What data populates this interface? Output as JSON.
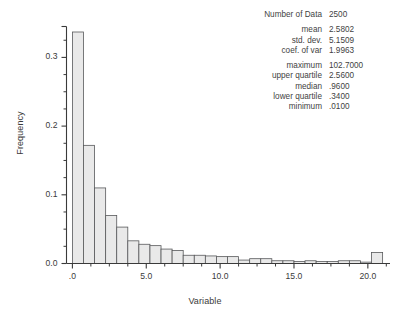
{
  "stats": {
    "rows": [
      {
        "label": "Number of Data",
        "value": "2500"
      },
      {
        "label": "mean",
        "value": "2.5802"
      },
      {
        "label": "std. dev.",
        "value": "5.1509"
      },
      {
        "label": "coef. of var",
        "value": "1.9963"
      },
      {
        "label": "maximum",
        "value": "102.7000"
      },
      {
        "label": "upper quartile",
        "value": "2.5600"
      },
      {
        "label": "median",
        "value": ".9600"
      },
      {
        "label": "lower quartile",
        "value": ".3400"
      },
      {
        "label": "minimum",
        "value": ".0100"
      }
    ]
  },
  "chart_data": {
    "type": "bar",
    "title": "",
    "xlabel": "Variable",
    "ylabel": "Frequency",
    "xlim": [
      -0.4,
      21.5
    ],
    "ylim": [
      0.0,
      0.345
    ],
    "grid": false,
    "legend": null,
    "bin_width": 0.75,
    "xticks": [
      0.0,
      5.0,
      10.0,
      15.0,
      20.0
    ],
    "xtick_labels": [
      ".0",
      "5.0",
      "10.0",
      "15.0",
      "20.0"
    ],
    "xminor_step": 1.25,
    "yticks": [
      0.0,
      0.1,
      0.2,
      0.3
    ],
    "ytick_labels": [
      "0.0",
      "0.1",
      "0.2",
      "0.3"
    ],
    "yminor_step": 0.025,
    "bar_fill": "#e9e9e9",
    "bar_stroke": "#58595b",
    "axis_color": "#3a3a3a",
    "bins": [
      {
        "x0": 0.0,
        "x1": 0.75,
        "value": 0.337
      },
      {
        "x0": 0.75,
        "x1": 1.5,
        "value": 0.172
      },
      {
        "x0": 1.5,
        "x1": 2.25,
        "value": 0.11
      },
      {
        "x0": 2.25,
        "x1": 3.0,
        "value": 0.07
      },
      {
        "x0": 3.0,
        "x1": 3.75,
        "value": 0.053
      },
      {
        "x0": 3.75,
        "x1": 4.5,
        "value": 0.033
      },
      {
        "x0": 4.5,
        "x1": 5.25,
        "value": 0.028
      },
      {
        "x0": 5.25,
        "x1": 6.0,
        "value": 0.026
      },
      {
        "x0": 6.0,
        "x1": 6.75,
        "value": 0.021
      },
      {
        "x0": 6.75,
        "x1": 7.5,
        "value": 0.019
      },
      {
        "x0": 7.5,
        "x1": 8.25,
        "value": 0.012
      },
      {
        "x0": 8.25,
        "x1": 9.0,
        "value": 0.012
      },
      {
        "x0": 9.0,
        "x1": 9.75,
        "value": 0.011
      },
      {
        "x0": 9.75,
        "x1": 10.5,
        "value": 0.01
      },
      {
        "x0": 10.5,
        "x1": 11.25,
        "value": 0.01
      },
      {
        "x0": 11.25,
        "x1": 12.0,
        "value": 0.005
      },
      {
        "x0": 12.0,
        "x1": 12.75,
        "value": 0.007
      },
      {
        "x0": 12.75,
        "x1": 13.5,
        "value": 0.007
      },
      {
        "x0": 13.5,
        "x1": 14.25,
        "value": 0.004
      },
      {
        "x0": 14.25,
        "x1": 15.0,
        "value": 0.004
      },
      {
        "x0": 15.0,
        "x1": 15.75,
        "value": 0.003
      },
      {
        "x0": 15.75,
        "x1": 16.5,
        "value": 0.004
      },
      {
        "x0": 16.5,
        "x1": 17.25,
        "value": 0.003
      },
      {
        "x0": 17.25,
        "x1": 18.0,
        "value": 0.003
      },
      {
        "x0": 18.0,
        "x1": 18.75,
        "value": 0.004
      },
      {
        "x0": 18.75,
        "x1": 19.5,
        "value": 0.004
      },
      {
        "x0": 19.5,
        "x1": 20.25,
        "value": 0.002
      },
      {
        "x0": 20.25,
        "x1": 21.0,
        "value": 0.016
      }
    ]
  }
}
